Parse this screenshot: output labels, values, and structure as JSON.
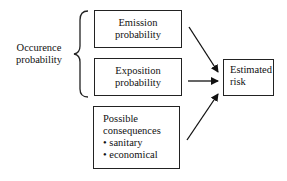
{
  "diagram": {
    "group_label": [
      "Occurence",
      "probability"
    ],
    "boxes": [
      {
        "id": "emission",
        "lines": [
          "Emission",
          "probability"
        ]
      },
      {
        "id": "exposition",
        "lines": [
          "Exposition",
          "probability"
        ]
      },
      {
        "id": "consequences",
        "lines": [
          "Possible",
          "consequences"
        ],
        "bullets": [
          "• sanitary",
          "• economical"
        ]
      }
    ],
    "output": {
      "lines": [
        "Estimated",
        "risk"
      ]
    },
    "edges": [
      {
        "from": "emission",
        "to": "output"
      },
      {
        "from": "exposition",
        "to": "output"
      },
      {
        "from": "consequences",
        "to": "output"
      }
    ],
    "colors": {
      "stroke": "#222222",
      "background": "#ffffff"
    }
  }
}
